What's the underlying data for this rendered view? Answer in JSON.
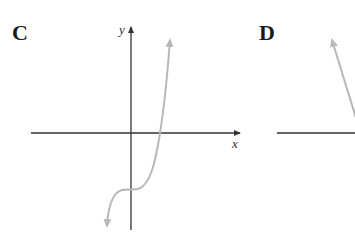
{
  "panels": [
    {
      "label": "C",
      "x_axis_label": "x",
      "y_axis_label": "y",
      "description": "Cubic-like curve: rises steeply in upper right, flattens near y-intercept below origin, descends to lower left"
    },
    {
      "label": "D",
      "x_axis_label": "",
      "y_axis_label": "",
      "description": "Partially visible graph: line descending from upper left toward x-axis"
    }
  ],
  "colors": {
    "axis": "#333333",
    "curve": "#b8b8b8",
    "label": "#1a1a1a"
  }
}
